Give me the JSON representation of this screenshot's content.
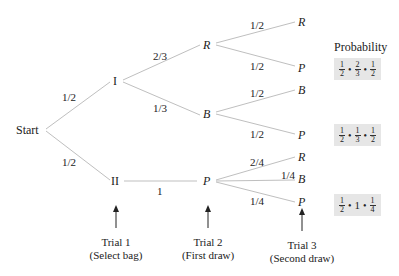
{
  "diagram": {
    "type": "probability-tree",
    "start_label": "Start",
    "stage1": {
      "nodes": [
        {
          "id": "I",
          "label": "I",
          "edge_prob": "1/2"
        },
        {
          "id": "II",
          "label": "II",
          "edge_prob": "1/2"
        }
      ]
    },
    "stage2": {
      "nodes": [
        {
          "id": "I-R",
          "parent": "I",
          "label": "R",
          "edge_prob": "2/3"
        },
        {
          "id": "I-B",
          "parent": "I",
          "label": "B",
          "edge_prob": "1/3"
        },
        {
          "id": "II-P",
          "parent": "II",
          "label": "P",
          "edge_prob": "1"
        }
      ]
    },
    "stage3": {
      "nodes": [
        {
          "id": "I-R-R",
          "parent": "I-R",
          "label": "R",
          "edge_prob": "1/2"
        },
        {
          "id": "I-R-P",
          "parent": "I-R",
          "label": "P",
          "edge_prob": "1/2"
        },
        {
          "id": "I-B-B",
          "parent": "I-B",
          "label": "B",
          "edge_prob": "1/2"
        },
        {
          "id": "I-B-P",
          "parent": "I-B",
          "label": "P",
          "edge_prob": "1/2"
        },
        {
          "id": "II-P-R",
          "parent": "II-P",
          "label": "R",
          "edge_prob": "2/4"
        },
        {
          "id": "II-P-B",
          "parent": "II-P",
          "label": "B",
          "edge_prob": "1/4"
        },
        {
          "id": "II-P-P",
          "parent": "II-P",
          "label": "P",
          "edge_prob": "1/4"
        }
      ]
    },
    "probability_header": "Probability",
    "probabilities": [
      {
        "path": "I-R-P",
        "factors": [
          [
            "1",
            "2"
          ],
          [
            "2",
            "3"
          ],
          [
            "1",
            "2"
          ]
        ]
      },
      {
        "path": "I-B-P",
        "factors": [
          [
            "1",
            "2"
          ],
          [
            "1",
            "3"
          ],
          [
            "1",
            "2"
          ]
        ]
      },
      {
        "path": "II-P-P",
        "factors": [
          [
            "1",
            "2"
          ],
          "1",
          [
            "1",
            "4"
          ]
        ]
      }
    ],
    "trials": [
      {
        "line1": "Trial 1",
        "line2": "(Select bag)"
      },
      {
        "line1": "Trial 2",
        "line2": "(First draw)"
      },
      {
        "line1": "Trial 3",
        "line2": "(Second draw)"
      }
    ]
  },
  "colors": {
    "edge": "#bfbfbf",
    "text": "#222222",
    "prob_box_bg": "#e6e6e6"
  }
}
